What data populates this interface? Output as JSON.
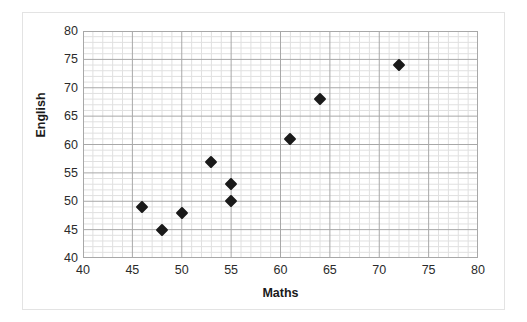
{
  "chart_data": {
    "type": "scatter",
    "title": "",
    "xlabel": "Maths",
    "ylabel": "English",
    "xlim": [
      40,
      80
    ],
    "ylim": [
      40,
      80
    ],
    "x_ticks": [
      40,
      45,
      50,
      55,
      60,
      65,
      70,
      75,
      80
    ],
    "y_ticks": [
      40,
      45,
      50,
      55,
      60,
      65,
      70,
      75,
      80
    ],
    "x_tick_labels": [
      "40",
      "45",
      "50",
      "55",
      "60",
      "65",
      "70",
      "75",
      "80"
    ],
    "y_tick_labels": [
      "40",
      "45",
      "50",
      "55",
      "60",
      "65",
      "70",
      "75",
      "80"
    ],
    "grid": true,
    "minor_grid": true,
    "legend": "none",
    "marker": "diamond",
    "marker_color": "#1a1a1a",
    "series": [
      {
        "name": "Maths vs English",
        "points": [
          {
            "x": 46,
            "y": 49
          },
          {
            "x": 48,
            "y": 45
          },
          {
            "x": 50,
            "y": 48
          },
          {
            "x": 53,
            "y": 57
          },
          {
            "x": 55,
            "y": 53
          },
          {
            "x": 55,
            "y": 50
          },
          {
            "x": 61,
            "y": 61
          },
          {
            "x": 64,
            "y": 68
          },
          {
            "x": 72,
            "y": 74
          }
        ]
      }
    ]
  },
  "colors": {
    "marker": "#1a1a1a",
    "major_grid": "#a8a8a8",
    "minor_grid": "#e0e0e0",
    "frame_border": "#e3e3e3",
    "text": "#2b2b2b",
    "background": "#ffffff"
  }
}
